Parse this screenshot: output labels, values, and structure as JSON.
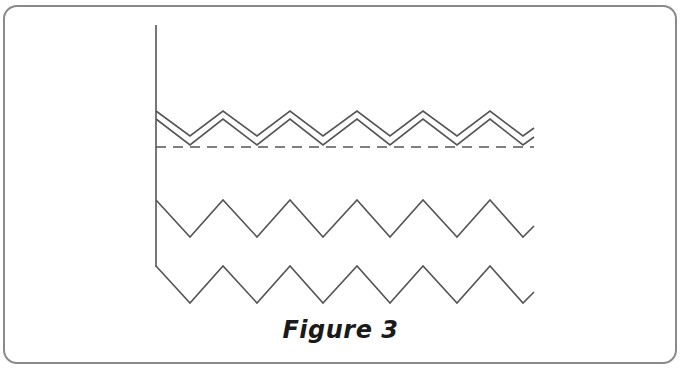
{
  "figure": {
    "caption": "Figure 3",
    "colors": {
      "line": "#555555",
      "border": "#8a8a8a",
      "background": "#ffffff",
      "caption": "#1a1a1a"
    },
    "axis": {
      "x": 156,
      "y_top": 25,
      "y_bottom": 267
    },
    "zigzags": [
      {
        "name": "double-zigzag-upper",
        "style": "solid",
        "start": [
          156,
          111
        ],
        "points": "156,111 190,136 223,111 257,136 290,111 323,136 357,111 390,136 423,111 457,136 490,111 523,136 534,128"
      },
      {
        "name": "double-zigzag-lower",
        "style": "solid",
        "start": [
          156,
          119
        ],
        "points": "156,119 190,145 223,119 257,145 290,119 323,145 357,119 390,145 423,119 457,145 490,119 523,145 534,137"
      },
      {
        "name": "zigzag-middle",
        "style": "solid",
        "points": "156,200 190,237 223,200 257,237 290,200 323,237 357,200 390,237 423,200 457,237 490,200 523,237 534,226"
      },
      {
        "name": "zigzag-bottom",
        "style": "solid",
        "points": "156,266 190,303 223,266 257,303 290,266 323,303 357,266 390,303 423,266 457,303 490,266 523,303 534,292"
      }
    ],
    "dashed_baseline": {
      "y": 147,
      "x1": 156,
      "x2": 534,
      "dash": "10,7"
    }
  }
}
